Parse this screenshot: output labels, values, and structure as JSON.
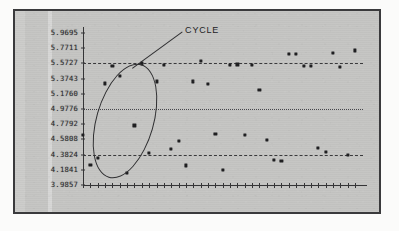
{
  "figure": {
    "background_color": "#c5c5c3",
    "frame_color": "#3a3a3c",
    "ink_color": "#1f1f21"
  },
  "annotation": {
    "label": "CYCLE"
  },
  "chart_data": {
    "type": "scatter",
    "title": "",
    "subtitle": "",
    "xlabel": "",
    "ylabel": "",
    "grid": false,
    "legend_position": "none",
    "ylim": [
      3.9857,
      5.9695
    ],
    "ytick_labels": [
      "5.9695",
      "5.7711",
      "5.5727",
      "5.3743",
      "5.1760",
      "4.9776",
      "4.7792",
      "4.5808",
      "4.3824",
      "4.1841",
      "3.9857"
    ],
    "ytick_values": [
      5.9695,
      5.7711,
      5.5727,
      5.3743,
      5.176,
      4.9776,
      4.7792,
      4.5808,
      4.3824,
      4.1841,
      3.9857
    ],
    "xtick_count": 38,
    "xtick_labels": [],
    "control_lines": [
      {
        "name": "UCL",
        "value": 5.5727,
        "style": "dashed",
        "label": ""
      },
      {
        "name": "Center Line",
        "value": 4.9776,
        "style": "dotted",
        "label": ""
      },
      {
        "name": "LCL",
        "value": 4.3824,
        "style": "dashed",
        "label": ""
      }
    ],
    "annotations": [
      {
        "text": "CYCLE",
        "kind": "ellipse-callout",
        "highlights_x_range": [
          3,
          11
        ],
        "note": "Ellipse encircles an alternating high-low cycling pattern"
      }
    ],
    "series": [
      {
        "name": "Individual Measurement",
        "marker": "square",
        "x": [
          1,
          2,
          3,
          4,
          5,
          6,
          7,
          8,
          9,
          10,
          11,
          12,
          13,
          14,
          15,
          16,
          17,
          18,
          19,
          20,
          21,
          22,
          23,
          24,
          25,
          26,
          27,
          28,
          29,
          30,
          31,
          32,
          33,
          34,
          35,
          36,
          37,
          38
        ],
        "values": [
          4.6405,
          4.2435,
          4.335,
          5.3105,
          5.54,
          5.407,
          4.1475,
          4.764,
          5.572,
          4.406,
          5.338,
          5.556,
          4.455,
          4.559,
          4.241,
          5.337,
          5.61,
          5.308,
          4.655,
          4.18,
          5.557,
          5.559,
          4.644,
          5.556,
          5.223,
          4.57,
          4.315,
          4.301,
          5.695,
          5.7,
          5.539,
          5.537,
          4.47,
          4.415,
          5.705,
          5.532,
          4.378,
          5.743
        ]
      }
    ]
  }
}
